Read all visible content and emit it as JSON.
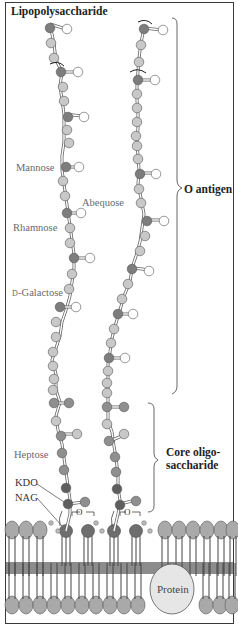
{
  "title": "Lipopolysaccharide",
  "labels": {
    "mannose": "Mannose",
    "abequose": "Abequose",
    "rhamnose": "Rhamnose",
    "galactose": "D-Galactose",
    "heptose": "Heptose",
    "kdo": "KDO",
    "nag": "NAG",
    "protein": "Protein",
    "oxygen_1": "O",
    "oxygen_2": "O"
  },
  "braces": {
    "o_antigen": "O antigen",
    "core_line1": "Core oligo-",
    "core_line2": "saccharide"
  },
  "colors": {
    "sugar_dark": "#7d7d7d",
    "sugar_light": "#c8c8c8",
    "sugar_white": "#ffffff",
    "sugar_core": "#8f8f8f",
    "kdo": "#5e5e5e",
    "membrane_head": "#a9a9a9",
    "membrane_band": "#8c8c8c",
    "protein": "#e6e6e6",
    "outline": "#3a3a3a"
  }
}
